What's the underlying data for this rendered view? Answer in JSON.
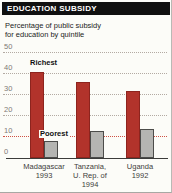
{
  "header": {
    "title": "EDUCATION SUBSIDY"
  },
  "subtitle": [
    "Percentage of public subsidy",
    "for education by quintile"
  ],
  "colors": {
    "header_bg": "#101010",
    "header_text": "#ffffff",
    "richest_bar": "#b2332b",
    "poorest_bar": "#b5b5b2",
    "gridline": "#b3aaa2",
    "poorest_gridline": "#cf5244",
    "card_bg": "#fcfcf8"
  },
  "chart_data": {
    "type": "bar",
    "title": "EDUCATION SUBSIDY",
    "subtitle": "Percentage of public subsidy for education by quintile",
    "categories": [
      [
        "Madagascar",
        "1993"
      ],
      [
        "Tanzania,",
        "U. Rep. of",
        "1994"
      ],
      [
        "Uganda",
        "1992"
      ]
    ],
    "series": [
      {
        "name": "Richest",
        "color": "#b2332b",
        "values": [
          41,
          36,
          32
        ]
      },
      {
        "name": "Poorest",
        "color": "#b5b5b2",
        "values": [
          8,
          13,
          14
        ]
      }
    ],
    "xlabel": "",
    "ylabel": "",
    "ylim": [
      0,
      50
    ],
    "yticks": [
      0,
      10,
      20,
      30,
      40,
      50
    ],
    "grid": "horizontal-dotted",
    "annotations": [
      {
        "text": "Richest",
        "points_to": "richest bars"
      },
      {
        "text": "Poorest",
        "points_to": "poorest bars",
        "line_color": "#cf5244",
        "line_value": 10
      }
    ],
    "legend_position": "in-plot labels"
  }
}
